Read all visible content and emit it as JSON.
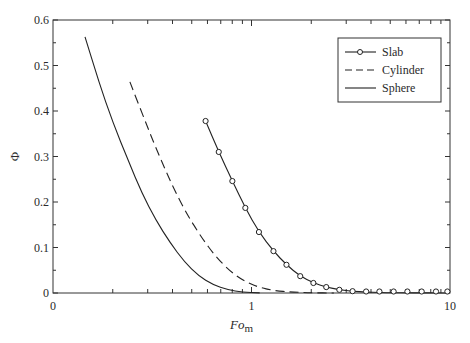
{
  "chart_data": {
    "type": "line",
    "title": "",
    "xlabel": "Fo",
    "xlabel_sub": "m",
    "ylabel": "Φ",
    "xscale": "log",
    "xlim": [
      0.1,
      10
    ],
    "ylim": [
      0,
      0.6
    ],
    "x_tick_labels": [
      {
        "value": 0.1,
        "label": "0"
      },
      {
        "value": 1,
        "label": "1"
      },
      {
        "value": 10,
        "label": "10"
      }
    ],
    "y_ticks": [
      0,
      0.1,
      0.2,
      0.3,
      0.4,
      0.5,
      0.6
    ],
    "y_tick_labels": [
      "0",
      "0.1",
      "0.2",
      "0.3",
      "0.4",
      "0.5",
      "0.6"
    ],
    "grid": false,
    "legend_position": "top-right",
    "series": [
      {
        "name": "Slab",
        "style": "solid-with-circle-markers",
        "x": [
          0.587,
          0.684,
          0.801,
          0.931,
          1.09,
          1.29,
          1.5,
          1.76,
          2.05,
          2.38,
          2.77,
          3.23,
          3.78,
          4.41,
          5.2,
          6.1,
          7.2,
          8.5,
          9.7
        ],
        "y": [
          0.378,
          0.31,
          0.246,
          0.187,
          0.134,
          0.092,
          0.062,
          0.037,
          0.022,
          0.013,
          0.007,
          0.004,
          0.002,
          0.001,
          0.0005,
          0.0003,
          0.0002,
          0.0001,
          0.0001
        ]
      },
      {
        "name": "Cylinder",
        "style": "dashed",
        "x": [
          0.244,
          0.29,
          0.34,
          0.4,
          0.47,
          0.56,
          0.66,
          0.78,
          0.92,
          1.08,
          1.3,
          1.6,
          2.0,
          2.6
        ],
        "y": [
          0.464,
          0.38,
          0.305,
          0.235,
          0.175,
          0.122,
          0.08,
          0.048,
          0.026,
          0.013,
          0.005,
          0.002,
          0.0005,
          0.0001
        ]
      },
      {
        "name": "Sphere",
        "style": "solid",
        "x": [
          0.145,
          0.17,
          0.2,
          0.24,
          0.28,
          0.33,
          0.39,
          0.46,
          0.54,
          0.64,
          0.76,
          0.9,
          1.1
        ],
        "y": [
          0.563,
          0.465,
          0.375,
          0.29,
          0.22,
          0.16,
          0.11,
          0.068,
          0.038,
          0.018,
          0.007,
          0.002,
          0.0003
        ]
      }
    ]
  }
}
